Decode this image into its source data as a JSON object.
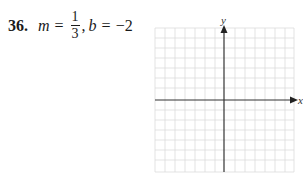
{
  "problem": {
    "number": "36.",
    "m_var": "m",
    "equals1": "=",
    "m_numerator": "1",
    "m_denominator": "3",
    "comma": ",",
    "b_var": "b",
    "equals2": "=",
    "b_value": "−2"
  },
  "graph": {
    "x_label": "x",
    "y_label": "y",
    "grid_color": "#d9d9d9",
    "axis_color": "#333333",
    "columns": 14,
    "rows": 14
  }
}
